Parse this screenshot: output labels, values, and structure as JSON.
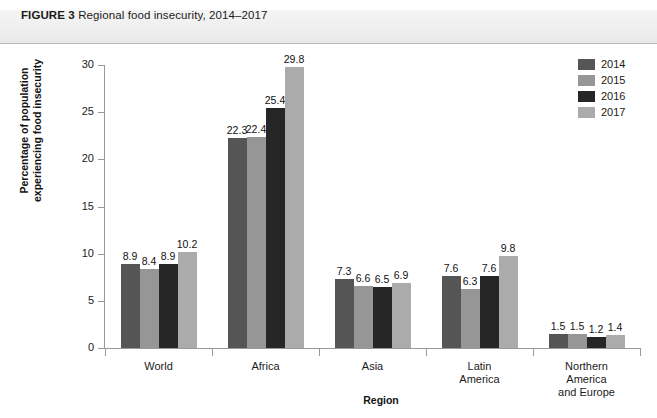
{
  "figure": {
    "label": "FIGURE 3",
    "caption": "Regional food insecurity, 2014–2017"
  },
  "chart_data": {
    "type": "bar",
    "title": "Regional food insecurity, 2014–2017",
    "xlabel": "Region",
    "ylabel": "Percentage of population experiencing food insecurity",
    "ylabel_lines": [
      "Percentage of population",
      "experiencing food insecurity"
    ],
    "ylim": [
      0,
      30
    ],
    "yticks": [
      0,
      5,
      10,
      15,
      20,
      25,
      30
    ],
    "ytick_labels": [
      "0",
      "5",
      "10",
      "15",
      "20",
      "25",
      "30"
    ],
    "grid": false,
    "legend_position": "top-right",
    "categories": [
      "World",
      "Africa",
      "Asia",
      "Latin America",
      "Northern America and Europe"
    ],
    "category_label_lines": [
      [
        "World"
      ],
      [
        "Africa"
      ],
      [
        "Asia"
      ],
      [
        "Latin",
        "America"
      ],
      [
        "Northern",
        "America",
        "and Europe"
      ]
    ],
    "series": [
      {
        "name": "2014",
        "color": "#555555",
        "values": [
          8.9,
          22.3,
          7.3,
          7.6,
          1.5
        ]
      },
      {
        "name": "2015",
        "color": "#969696",
        "values": [
          8.4,
          22.4,
          6.6,
          6.3,
          1.5
        ]
      },
      {
        "name": "2016",
        "color": "#262626",
        "values": [
          8.9,
          25.4,
          6.5,
          7.6,
          1.2
        ]
      },
      {
        "name": "2017",
        "color": "#ababab",
        "values": [
          10.2,
          29.8,
          6.9,
          9.8,
          1.4
        ]
      }
    ],
    "value_labels": [
      [
        "8.9",
        "8.4",
        "8.9",
        "10.2"
      ],
      [
        "22.3",
        "22.4",
        "25.4",
        "29.8"
      ],
      [
        "7.3",
        "6.6",
        "6.5",
        "6.9"
      ],
      [
        "7.6",
        "6.3",
        "7.6",
        "9.8"
      ],
      [
        "1.5",
        "1.5",
        "1.2",
        "1.4"
      ]
    ]
  },
  "colors": {
    "header_band": "#efefef",
    "axis": "#9a9a9a",
    "text": "#1b1b1b"
  }
}
